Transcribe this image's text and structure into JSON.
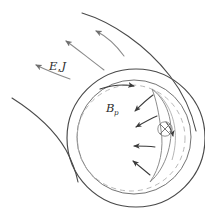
{
  "figure": {
    "domain": "physics-diagram",
    "background_color": "#ffffff",
    "line_color_dark": "#3a3a3a",
    "line_color_mid": "#6e6e6e",
    "line_color_light": "#a6a6a6",
    "dashed_color": "#b0b0b0"
  },
  "labels": {
    "electric_field_current": {
      "text": "E, J",
      "base": "E",
      "comma": ",",
      "second": "J",
      "meaning": "electric-field-and-current-density"
    },
    "poloidal_field": {
      "text": "Bp",
      "base": "B",
      "subscript": "p",
      "meaning": "poloidal-magnetic-field"
    },
    "into_page_vector": {
      "symbol": "circled-cross",
      "meaning": "vector-into-page"
    }
  },
  "elements": {
    "outer_circle": {
      "name": "outer-boundary-circle",
      "cx": 136,
      "cy": 138,
      "r": 69
    },
    "inner_circle": {
      "name": "inner-boundary-circle",
      "cx": 134,
      "cy": 137,
      "r": 57
    },
    "dashed_circle": {
      "name": "poloidal-field-dashed-loop",
      "cx": 131,
      "cy": 138,
      "rx": 54,
      "ry": 53
    },
    "crescent": {
      "name": "crescent-flux-rope"
    },
    "spiral_arm_upper": {
      "name": "spiral-arm-upper"
    },
    "spiral_arm_lower_left": {
      "name": "spiral-arm-lower-left"
    },
    "outward_arrows_count": 3,
    "crescent_arrows_count": 4
  }
}
